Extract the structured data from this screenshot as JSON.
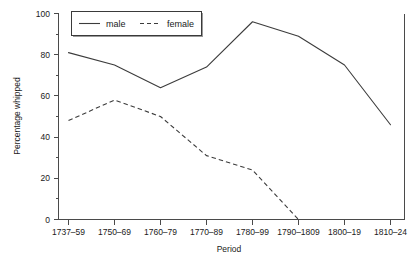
{
  "chart_data": {
    "type": "line",
    "title": "",
    "xlabel": "Period",
    "ylabel": "Percentage whipped",
    "categories": [
      "1737–59",
      "1750–69",
      "1760–79",
      "1770–89",
      "1780–99",
      "1790–1809",
      "1800–19",
      "1810–24"
    ],
    "series": [
      {
        "name": "male",
        "style": "solid",
        "values": [
          81,
          75,
          64,
          74,
          96,
          89,
          75,
          46
        ]
      },
      {
        "name": "female",
        "style": "dashed",
        "values": [
          48,
          58,
          50,
          31,
          24,
          0,
          null,
          null
        ]
      }
    ],
    "ylim": [
      0,
      100
    ],
    "yticks": [
      0,
      20,
      40,
      60,
      80,
      100
    ],
    "yticklabels": [
      "0",
      "20",
      "40",
      "60",
      "80",
      "100"
    ],
    "yminorticks": [
      10,
      30,
      50,
      70,
      90
    ],
    "grid": false,
    "legend": {
      "position": "top-inside",
      "entries": [
        {
          "label": "male",
          "style": "solid"
        },
        {
          "label": "female",
          "style": "dashed"
        }
      ]
    }
  }
}
